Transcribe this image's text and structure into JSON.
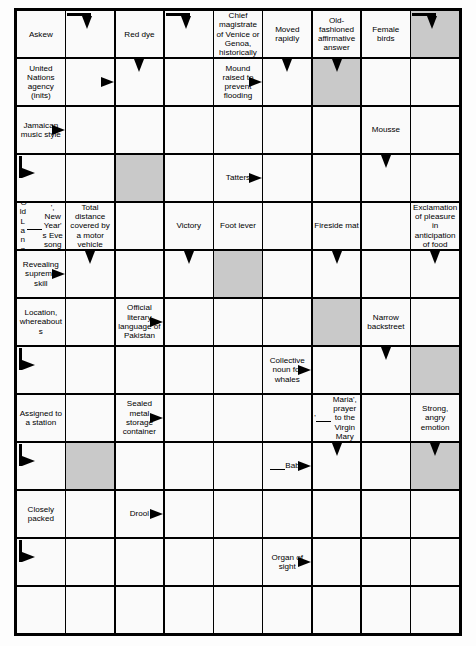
{
  "puzzle": {
    "type": "arrowword-crossword",
    "columns": 9,
    "rows": 13,
    "colors": {
      "grid_line": "#000000",
      "cell_background": "#fafafa",
      "shaded_cell": "#c9c9c9",
      "text": "#000000"
    },
    "cells": [
      {
        "r": 0,
        "c": 0,
        "text": "Askew",
        "arrow": "",
        "shaded": false
      },
      {
        "r": 0,
        "c": 1,
        "text": "",
        "arrow": "right-down",
        "shaded": false
      },
      {
        "r": 0,
        "c": 2,
        "text": "Red dye",
        "arrow": "",
        "shaded": false
      },
      {
        "r": 0,
        "c": 3,
        "text": "",
        "arrow": "right-down",
        "shaded": false
      },
      {
        "r": 0,
        "c": 4,
        "text": "Chief magistrate of Venice or Genoa, historically",
        "arrow": "",
        "shaded": false
      },
      {
        "r": 0,
        "c": 5,
        "text": "Moved rapidly",
        "arrow": "",
        "shaded": false
      },
      {
        "r": 0,
        "c": 6,
        "text": "Old-fashioned affirmative answer",
        "arrow": "",
        "shaded": false
      },
      {
        "r": 0,
        "c": 7,
        "text": "Female birds",
        "arrow": "",
        "shaded": false
      },
      {
        "r": 0,
        "c": 8,
        "text": "",
        "arrow": "right-down",
        "shaded": true
      },
      {
        "r": 1,
        "c": 0,
        "text": "United Nations agency (inits)",
        "arrow": "",
        "shaded": false
      },
      {
        "r": 1,
        "c": 1,
        "text": "",
        "arrow": "right",
        "shaded": false
      },
      {
        "r": 1,
        "c": 2,
        "text": "",
        "arrow": "down",
        "shaded": false
      },
      {
        "r": 1,
        "c": 3,
        "text": "",
        "arrow": "",
        "shaded": false
      },
      {
        "r": 1,
        "c": 4,
        "text": "Mound raised to prevent flooding",
        "arrow": "right",
        "shaded": false
      },
      {
        "r": 1,
        "c": 5,
        "text": "",
        "arrow": "down",
        "shaded": false
      },
      {
        "r": 1,
        "c": 6,
        "text": "",
        "arrow": "down",
        "shaded": true
      },
      {
        "r": 1,
        "c": 7,
        "text": "",
        "arrow": "",
        "shaded": false
      },
      {
        "r": 1,
        "c": 8,
        "text": "",
        "arrow": "",
        "shaded": false
      },
      {
        "r": 2,
        "c": 0,
        "text": "Jamaican music style",
        "arrow": "right",
        "shaded": false
      },
      {
        "r": 2,
        "c": 1,
        "text": "",
        "arrow": "",
        "shaded": false
      },
      {
        "r": 2,
        "c": 2,
        "text": "",
        "arrow": "",
        "shaded": false
      },
      {
        "r": 2,
        "c": 3,
        "text": "",
        "arrow": "",
        "shaded": false
      },
      {
        "r": 2,
        "c": 4,
        "text": "",
        "arrow": "",
        "shaded": false
      },
      {
        "r": 2,
        "c": 5,
        "text": "",
        "arrow": "",
        "shaded": false
      },
      {
        "r": 2,
        "c": 6,
        "text": "",
        "arrow": "",
        "shaded": false
      },
      {
        "r": 2,
        "c": 7,
        "text": "Mousse",
        "arrow": "",
        "shaded": false
      },
      {
        "r": 2,
        "c": 8,
        "text": "",
        "arrow": "",
        "shaded": false
      },
      {
        "r": 3,
        "c": 0,
        "text": "",
        "arrow": "down-right",
        "shaded": false
      },
      {
        "r": 3,
        "c": 1,
        "text": "",
        "arrow": "",
        "shaded": false
      },
      {
        "r": 3,
        "c": 2,
        "text": "",
        "arrow": "",
        "shaded": true
      },
      {
        "r": 3,
        "c": 3,
        "text": "",
        "arrow": "",
        "shaded": false
      },
      {
        "r": 3,
        "c": 4,
        "text": "Tatters",
        "arrow": "right",
        "shaded": false
      },
      {
        "r": 3,
        "c": 5,
        "text": "",
        "arrow": "",
        "shaded": false
      },
      {
        "r": 3,
        "c": 6,
        "text": "",
        "arrow": "",
        "shaded": false
      },
      {
        "r": 3,
        "c": 7,
        "text": "",
        "arrow": "down",
        "shaded": false
      },
      {
        "r": 3,
        "c": 8,
        "text": "",
        "arrow": "",
        "shaded": false
      },
      {
        "r": 4,
        "c": 0,
        "text": "'Old Lang ___', New Year's Eve song",
        "arrow": "",
        "shaded": false
      },
      {
        "r": 4,
        "c": 1,
        "text": "Total distance covered by a motor vehicle",
        "arrow": "",
        "shaded": false
      },
      {
        "r": 4,
        "c": 2,
        "text": "",
        "arrow": "",
        "shaded": false
      },
      {
        "r": 4,
        "c": 3,
        "text": "Victory",
        "arrow": "",
        "shaded": false
      },
      {
        "r": 4,
        "c": 4,
        "text": "Foot lever",
        "arrow": "",
        "shaded": false
      },
      {
        "r": 4,
        "c": 5,
        "text": "",
        "arrow": "",
        "shaded": false
      },
      {
        "r": 4,
        "c": 6,
        "text": "Fireside mat",
        "arrow": "",
        "shaded": false
      },
      {
        "r": 4,
        "c": 7,
        "text": "",
        "arrow": "",
        "shaded": false
      },
      {
        "r": 4,
        "c": 8,
        "text": "Exclamation of pleasure in anticipation of food",
        "arrow": "",
        "shaded": false
      },
      {
        "r": 5,
        "c": 0,
        "text": "Revealing supreme skill",
        "arrow": "right",
        "shaded": false
      },
      {
        "r": 5,
        "c": 1,
        "text": "",
        "arrow": "down",
        "shaded": false
      },
      {
        "r": 5,
        "c": 2,
        "text": "",
        "arrow": "",
        "shaded": false
      },
      {
        "r": 5,
        "c": 3,
        "text": "",
        "arrow": "down",
        "shaded": false
      },
      {
        "r": 5,
        "c": 4,
        "text": "",
        "arrow": "",
        "shaded": true
      },
      {
        "r": 5,
        "c": 5,
        "text": "",
        "arrow": "",
        "shaded": false
      },
      {
        "r": 5,
        "c": 6,
        "text": "",
        "arrow": "down",
        "shaded": false
      },
      {
        "r": 5,
        "c": 7,
        "text": "",
        "arrow": "",
        "shaded": false
      },
      {
        "r": 5,
        "c": 8,
        "text": "",
        "arrow": "down",
        "shaded": false
      },
      {
        "r": 6,
        "c": 0,
        "text": "Location, whereabouts",
        "arrow": "",
        "shaded": false
      },
      {
        "r": 6,
        "c": 1,
        "text": "",
        "arrow": "",
        "shaded": false
      },
      {
        "r": 6,
        "c": 2,
        "text": "Official literary language of Pakistan",
        "arrow": "right",
        "shaded": false
      },
      {
        "r": 6,
        "c": 3,
        "text": "",
        "arrow": "",
        "shaded": false
      },
      {
        "r": 6,
        "c": 4,
        "text": "",
        "arrow": "",
        "shaded": false
      },
      {
        "r": 6,
        "c": 5,
        "text": "",
        "arrow": "",
        "shaded": false
      },
      {
        "r": 6,
        "c": 6,
        "text": "",
        "arrow": "",
        "shaded": true
      },
      {
        "r": 6,
        "c": 7,
        "text": "Narrow backstreet",
        "arrow": "",
        "shaded": false
      },
      {
        "r": 6,
        "c": 8,
        "text": "",
        "arrow": "",
        "shaded": false
      },
      {
        "r": 7,
        "c": 0,
        "text": "",
        "arrow": "down-right",
        "shaded": false
      },
      {
        "r": 7,
        "c": 1,
        "text": "",
        "arrow": "",
        "shaded": false
      },
      {
        "r": 7,
        "c": 2,
        "text": "",
        "arrow": "",
        "shaded": false
      },
      {
        "r": 7,
        "c": 3,
        "text": "",
        "arrow": "",
        "shaded": false
      },
      {
        "r": 7,
        "c": 4,
        "text": "",
        "arrow": "",
        "shaded": false
      },
      {
        "r": 7,
        "c": 5,
        "text": "Collective noun for whales",
        "arrow": "right",
        "shaded": false
      },
      {
        "r": 7,
        "c": 6,
        "text": "",
        "arrow": "",
        "shaded": false
      },
      {
        "r": 7,
        "c": 7,
        "text": "",
        "arrow": "down",
        "shaded": false
      },
      {
        "r": 7,
        "c": 8,
        "text": "",
        "arrow": "",
        "shaded": true
      },
      {
        "r": 8,
        "c": 0,
        "text": "Assigned to a station",
        "arrow": "",
        "shaded": false
      },
      {
        "r": 8,
        "c": 1,
        "text": "",
        "arrow": "",
        "shaded": false
      },
      {
        "r": 8,
        "c": 2,
        "text": "Sealed metal storage container",
        "arrow": "right",
        "shaded": false
      },
      {
        "r": 8,
        "c": 3,
        "text": "",
        "arrow": "",
        "shaded": false
      },
      {
        "r": 8,
        "c": 4,
        "text": "",
        "arrow": "",
        "shaded": false
      },
      {
        "r": 8,
        "c": 5,
        "text": "",
        "arrow": "",
        "shaded": false
      },
      {
        "r": 8,
        "c": 6,
        "text": "'___ Maria', prayer to the Virgin Mary",
        "arrow": "",
        "shaded": false
      },
      {
        "r": 8,
        "c": 7,
        "text": "",
        "arrow": "",
        "shaded": false
      },
      {
        "r": 8,
        "c": 8,
        "text": "Strong, angry emotion",
        "arrow": "",
        "shaded": false
      },
      {
        "r": 9,
        "c": 0,
        "text": "",
        "arrow": "down-right",
        "shaded": false
      },
      {
        "r": 9,
        "c": 1,
        "text": "",
        "arrow": "",
        "shaded": true
      },
      {
        "r": 9,
        "c": 2,
        "text": "",
        "arrow": "",
        "shaded": false
      },
      {
        "r": 9,
        "c": 3,
        "text": "",
        "arrow": "",
        "shaded": false
      },
      {
        "r": 9,
        "c": 4,
        "text": "",
        "arrow": "",
        "shaded": false
      },
      {
        "r": 9,
        "c": 5,
        "text": "___ Baba",
        "arrow": "right",
        "shaded": false
      },
      {
        "r": 9,
        "c": 6,
        "text": "",
        "arrow": "down",
        "shaded": false
      },
      {
        "r": 9,
        "c": 7,
        "text": "",
        "arrow": "",
        "shaded": false
      },
      {
        "r": 9,
        "c": 8,
        "text": "",
        "arrow": "down",
        "shaded": true
      },
      {
        "r": 10,
        "c": 0,
        "text": "Closely packed",
        "arrow": "",
        "shaded": false
      },
      {
        "r": 10,
        "c": 1,
        "text": "",
        "arrow": "",
        "shaded": false
      },
      {
        "r": 10,
        "c": 2,
        "text": "Drool",
        "arrow": "right",
        "shaded": false
      },
      {
        "r": 10,
        "c": 3,
        "text": "",
        "arrow": "",
        "shaded": false
      },
      {
        "r": 10,
        "c": 4,
        "text": "",
        "arrow": "",
        "shaded": false
      },
      {
        "r": 10,
        "c": 5,
        "text": "",
        "arrow": "",
        "shaded": false
      },
      {
        "r": 10,
        "c": 6,
        "text": "",
        "arrow": "",
        "shaded": false
      },
      {
        "r": 10,
        "c": 7,
        "text": "",
        "arrow": "",
        "shaded": false
      },
      {
        "r": 10,
        "c": 8,
        "text": "",
        "arrow": "",
        "shaded": false
      },
      {
        "r": 11,
        "c": 0,
        "text": "",
        "arrow": "down-right",
        "shaded": false
      },
      {
        "r": 11,
        "c": 1,
        "text": "",
        "arrow": "",
        "shaded": false
      },
      {
        "r": 11,
        "c": 2,
        "text": "",
        "arrow": "",
        "shaded": false
      },
      {
        "r": 11,
        "c": 3,
        "text": "",
        "arrow": "",
        "shaded": false
      },
      {
        "r": 11,
        "c": 4,
        "text": "",
        "arrow": "",
        "shaded": false
      },
      {
        "r": 11,
        "c": 5,
        "text": "Organ of sight",
        "arrow": "right",
        "shaded": false
      },
      {
        "r": 11,
        "c": 6,
        "text": "",
        "arrow": "",
        "shaded": false
      },
      {
        "r": 11,
        "c": 7,
        "text": "",
        "arrow": "",
        "shaded": false
      },
      {
        "r": 11,
        "c": 8,
        "text": "",
        "arrow": "",
        "shaded": false
      },
      {
        "r": 12,
        "c": 0,
        "text": "",
        "arrow": "",
        "shaded": false
      },
      {
        "r": 12,
        "c": 1,
        "text": "",
        "arrow": "",
        "shaded": false
      },
      {
        "r": 12,
        "c": 2,
        "text": "",
        "arrow": "",
        "shaded": false
      },
      {
        "r": 12,
        "c": 3,
        "text": "",
        "arrow": "",
        "shaded": false
      },
      {
        "r": 12,
        "c": 4,
        "text": "",
        "arrow": "",
        "shaded": false
      },
      {
        "r": 12,
        "c": 5,
        "text": "",
        "arrow": "",
        "shaded": false
      },
      {
        "r": 12,
        "c": 6,
        "text": "",
        "arrow": "",
        "shaded": false
      },
      {
        "r": 12,
        "c": 7,
        "text": "",
        "arrow": "",
        "shaded": false
      },
      {
        "r": 12,
        "c": 8,
        "text": "",
        "arrow": "",
        "shaded": false
      }
    ]
  }
}
